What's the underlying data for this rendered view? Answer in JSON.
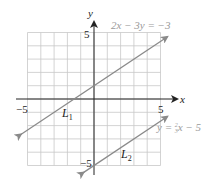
{
  "chart_data": {
    "type": "line",
    "title": "",
    "xlabel": "x",
    "ylabel": "y",
    "xlim": [
      -5,
      5
    ],
    "ylim": [
      -5,
      5
    ],
    "grid": true,
    "x_tick_labels": [
      "-5",
      "5"
    ],
    "y_tick_labels": [
      "5",
      "-5"
    ],
    "series": [
      {
        "name": "L1",
        "equation": "2x − 3y = −3",
        "slope": 0.6667,
        "intercept": 1,
        "x": [
          -5.5,
          5.5
        ],
        "y": [
          -2.667,
          4.667
        ]
      },
      {
        "name": "L2",
        "equation": "y = (2/3)x − 5",
        "slope": 0.6667,
        "intercept": -5,
        "x": [
          -0.8,
          5.5
        ],
        "y": [
          -5.533,
          -1.333
        ]
      }
    ],
    "annotations": [
      "2x − 3y = −3",
      "y = ⅔x − 5",
      "L1",
      "L2"
    ]
  },
  "labels": {
    "x_axis": "x",
    "y_axis": "y",
    "x_min": "−5",
    "x_max": "5",
    "y_max": "5",
    "y_min": "−5",
    "eq1": "2x − 3y = −3",
    "eq2_prefix": "y = ",
    "eq2_num": "2",
    "eq2_den": "3",
    "eq2_suffix": "x − 5",
    "line1": "L",
    "line1_sub": "1",
    "line2": "L",
    "line2_sub": "2"
  },
  "colors": {
    "grid": "#c8c8c8",
    "axis": "#222222",
    "line": "#8a8a8a",
    "equation_text": "#9a9a9a"
  }
}
